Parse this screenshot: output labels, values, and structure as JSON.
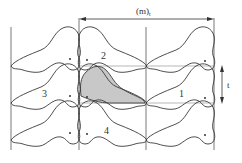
{
  "diagram": {
    "type": "periodic-tiling",
    "colors": {
      "line": "#3a3a3a",
      "grid": "#555555",
      "shade": "#c8c8c8",
      "background": "#ffffff"
    },
    "labels": {
      "horizontal_period": "(m)",
      "horizontal_period_sub": "t",
      "vertical_period": "t",
      "tile_1": "1",
      "tile_2": "2",
      "tile_3": "3",
      "tile_4": "4"
    },
    "grid": {
      "vertical_lines_x": [
        11,
        79,
        146,
        214
      ],
      "horizontal_lines_y": [
        66,
        103
      ],
      "columns": 3,
      "rows": 3
    }
  }
}
